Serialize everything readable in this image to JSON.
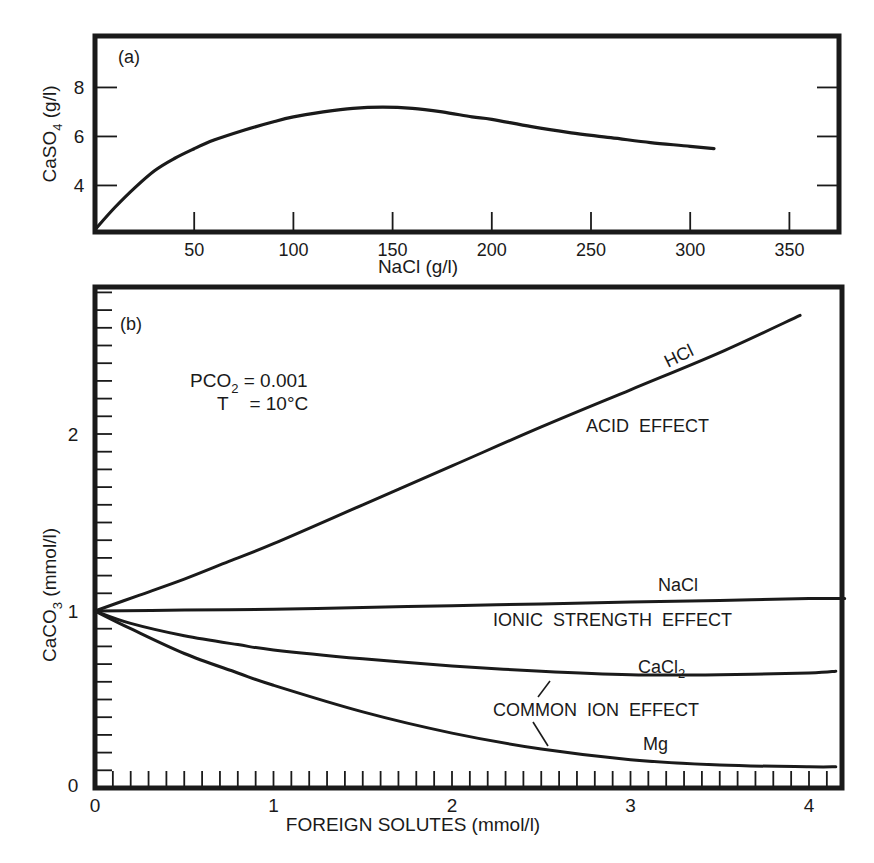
{
  "colors": {
    "ink": "#1a1a1a",
    "background": "#ffffff"
  },
  "chart_data": [
    {
      "id": "a",
      "type": "line",
      "panel_label": "(a)",
      "title": "",
      "xlabel": "NaCl (g/l)",
      "ylabel": "CaSO4 (g/l)",
      "ylabel_main": "CaSO",
      "ylabel_sub": "4",
      "ylabel_unit": " (g/l)",
      "xlim": [
        0,
        375
      ],
      "ylim": [
        2.1,
        10.1
      ],
      "x_ticks": [
        50,
        100,
        150,
        200,
        250,
        300,
        350
      ],
      "x_tick_labels": [
        "50",
        "100",
        "150",
        "200",
        "250",
        "300",
        "350"
      ],
      "y_ticks": [
        4,
        6,
        8
      ],
      "y_tick_labels": [
        "4",
        "6",
        "8"
      ],
      "grid": false,
      "series": [
        {
          "name": "CaSO4 solubility",
          "x": [
            0,
            10,
            20,
            30,
            40,
            50,
            60,
            75,
            90,
            100,
            115,
            130,
            145,
            160,
            175,
            190,
            200,
            220,
            240,
            260,
            280,
            300,
            312
          ],
          "y": [
            2.2,
            3.1,
            3.9,
            4.6,
            5.1,
            5.5,
            5.85,
            6.25,
            6.6,
            6.8,
            7.0,
            7.15,
            7.2,
            7.15,
            7.0,
            6.8,
            6.7,
            6.4,
            6.15,
            5.95,
            5.75,
            5.6,
            5.5
          ]
        }
      ]
    },
    {
      "id": "b",
      "type": "line",
      "panel_label": "(b)",
      "title": "",
      "xlabel": "FOREIGN SOLUTES (mmol/l)",
      "ylabel": "CaCO3 (mmol/l)",
      "ylabel_main": "CaCO",
      "ylabel_sub": "3",
      "ylabel_unit": " (mmol/l)",
      "xlim": [
        0,
        4.2
      ],
      "ylim": [
        0,
        2.85
      ],
      "x_ticks": [
        0,
        1,
        2,
        3,
        4
      ],
      "x_tick_labels": [
        "0",
        "1",
        "2",
        "3",
        "4"
      ],
      "x_minor_step": 0.1,
      "y_ticks": [
        0,
        1,
        2
      ],
      "y_tick_labels": [
        "0",
        "1",
        "2"
      ],
      "y_minor_step": 0.1,
      "grid": false,
      "annotations": {
        "conditions_line1_main": "PCO",
        "conditions_line1_sub": "2",
        "conditions_line1_rest": " = 0.001",
        "conditions_line2": "T    = 10°C",
        "acid_effect": "ACID  EFFECT",
        "ionic_strength_effect": "IONIC  STRENGTH  EFFECT",
        "common_ion_effect": "COMMON  ION  EFFECT"
      },
      "series": [
        {
          "name": "HCl",
          "label": "HCl",
          "x": [
            0,
            0.25,
            0.5,
            0.75,
            1.0,
            1.5,
            2.0,
            2.5,
            3.0,
            3.5,
            3.95
          ],
          "y": [
            1.0,
            1.09,
            1.18,
            1.28,
            1.38,
            1.6,
            1.82,
            2.04,
            2.25,
            2.46,
            2.67
          ]
        },
        {
          "name": "NaCl",
          "label": "NaCl",
          "x": [
            0,
            0.5,
            1.0,
            1.5,
            2.0,
            2.5,
            3.0,
            3.5,
            4.0,
            4.2
          ],
          "y": [
            1.0,
            1.005,
            1.01,
            1.02,
            1.03,
            1.04,
            1.05,
            1.06,
            1.07,
            1.07
          ]
        },
        {
          "name": "CaCl2",
          "label_main": "CaCl",
          "label_sub": "2",
          "x": [
            0,
            0.2,
            0.5,
            0.8,
            1.0,
            1.5,
            2.0,
            2.5,
            3.0,
            3.5,
            4.0,
            4.15
          ],
          "y": [
            1.0,
            0.93,
            0.86,
            0.81,
            0.78,
            0.73,
            0.69,
            0.66,
            0.64,
            0.64,
            0.65,
            0.66
          ]
        },
        {
          "name": "Mg",
          "label": "Mg",
          "x": [
            0,
            0.2,
            0.5,
            0.8,
            1.0,
            1.5,
            2.0,
            2.5,
            3.0,
            3.5,
            4.0,
            4.15
          ],
          "y": [
            1.0,
            0.9,
            0.76,
            0.65,
            0.58,
            0.43,
            0.31,
            0.22,
            0.16,
            0.13,
            0.12,
            0.12
          ]
        }
      ]
    }
  ]
}
